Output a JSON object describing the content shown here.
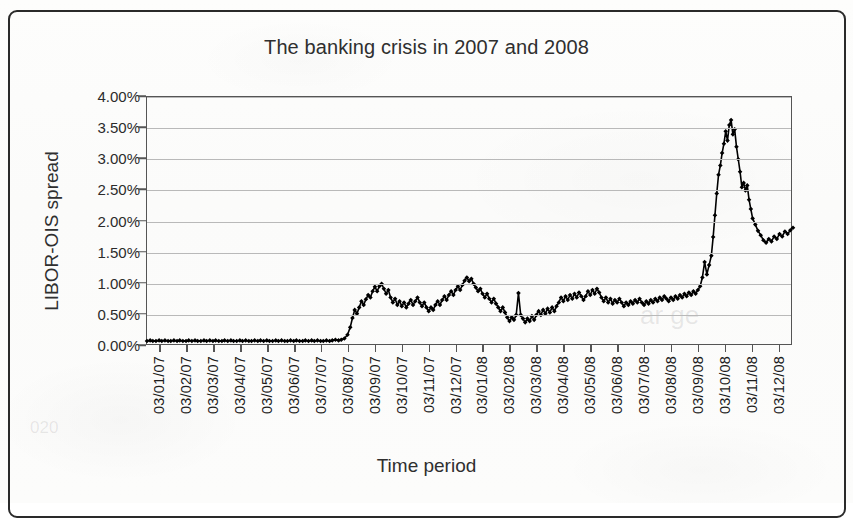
{
  "figure": {
    "title": "The banking crisis in 2007 and 2008",
    "xlabel": "Time period",
    "ylabel": "LIBOR-OIS spread"
  },
  "axes": {
    "y_ticks": [
      "0.00%",
      "0.50%",
      "1.00%",
      "1.50%",
      "2.00%",
      "2.50%",
      "3.00%",
      "3.50%",
      "4.00%"
    ],
    "x_ticks": [
      "03/01/07",
      "03/02/07",
      "03/03/07",
      "03/04/07",
      "03/05/07",
      "03/06/07",
      "03/07/07",
      "03/08/07",
      "03/09/07",
      "03/10/07",
      "03/11/07",
      "03/12/07",
      "03/01/08",
      "03/02/08",
      "03/03/08",
      "03/04/08",
      "03/05/08",
      "03/06/08",
      "03/07/08",
      "03/08/08",
      "03/09/08",
      "03/10/08",
      "03/11/08",
      "03/12/08"
    ]
  },
  "colors": {
    "series": "#000000",
    "gridline": "#b9b9b9",
    "axis": "#555555",
    "text": "#2b2b2b",
    "background": "#fdfdfc"
  },
  "chart_data": {
    "type": "line",
    "title": "The banking crisis in 2007 and 2008",
    "xlabel": "Time period",
    "ylabel": "LIBOR-OIS spread",
    "ylim": [
      0.0,
      4.0
    ],
    "ytick_step": 0.5,
    "grid": true,
    "legend": null,
    "units": "percent",
    "marker": "diamond",
    "x": [
      "03/01/07",
      "03/02/07",
      "03/03/07",
      "03/04/07",
      "03/05/07",
      "03/06/07",
      "03/07/07",
      "03/08/07",
      "03/09/07",
      "03/10/07",
      "03/11/07",
      "03/12/07",
      "03/01/08",
      "03/02/08",
      "03/03/08",
      "03/04/08",
      "03/05/08",
      "03/06/08",
      "03/07/08",
      "03/08/08",
      "03/09/08",
      "03/10/08",
      "03/11/08",
      "03/12/08"
    ],
    "series": [
      {
        "name": "LIBOR-OIS spread",
        "values": [
          0.08,
          0.08,
          0.09,
          0.08,
          0.08,
          0.09,
          0.09,
          0.7,
          0.85,
          0.72,
          0.8,
          1.05,
          0.6,
          0.48,
          0.62,
          0.78,
          0.78,
          0.72,
          0.76,
          0.8,
          1.2,
          3.4,
          2.0,
          1.85
        ]
      }
    ],
    "points": [
      [
        0.0,
        0.08
      ],
      [
        0.007,
        0.09
      ],
      [
        0.013,
        0.08
      ],
      [
        0.02,
        0.08
      ],
      [
        0.027,
        0.09
      ],
      [
        0.033,
        0.08
      ],
      [
        0.04,
        0.09
      ],
      [
        0.047,
        0.08
      ],
      [
        0.053,
        0.08
      ],
      [
        0.06,
        0.09
      ],
      [
        0.067,
        0.08
      ],
      [
        0.073,
        0.09
      ],
      [
        0.08,
        0.08
      ],
      [
        0.087,
        0.08
      ],
      [
        0.093,
        0.09
      ],
      [
        0.1,
        0.08
      ],
      [
        0.107,
        0.09
      ],
      [
        0.113,
        0.08
      ],
      [
        0.12,
        0.08
      ],
      [
        0.127,
        0.09
      ],
      [
        0.133,
        0.08
      ],
      [
        0.14,
        0.09
      ],
      [
        0.147,
        0.08
      ],
      [
        0.153,
        0.09
      ],
      [
        0.16,
        0.08
      ],
      [
        0.167,
        0.08
      ],
      [
        0.173,
        0.09
      ],
      [
        0.18,
        0.08
      ],
      [
        0.187,
        0.09
      ],
      [
        0.193,
        0.08
      ],
      [
        0.2,
        0.08
      ],
      [
        0.207,
        0.09
      ],
      [
        0.213,
        0.08
      ],
      [
        0.22,
        0.09
      ],
      [
        0.227,
        0.08
      ],
      [
        0.233,
        0.08
      ],
      [
        0.24,
        0.09
      ],
      [
        0.247,
        0.08
      ],
      [
        0.253,
        0.09
      ],
      [
        0.26,
        0.08
      ],
      [
        0.267,
        0.09
      ],
      [
        0.273,
        0.08
      ],
      [
        0.28,
        0.08
      ],
      [
        0.287,
        0.09
      ],
      [
        0.293,
        0.08
      ],
      [
        0.3,
        0.09
      ],
      [
        0.307,
        0.08
      ],
      [
        0.313,
        0.08
      ],
      [
        0.32,
        0.09
      ],
      [
        0.327,
        0.08
      ],
      [
        0.333,
        0.09
      ],
      [
        0.34,
        0.08
      ],
      [
        0.347,
        0.08
      ],
      [
        0.353,
        0.09
      ],
      [
        0.36,
        0.08
      ],
      [
        0.367,
        0.09
      ],
      [
        0.373,
        0.08
      ],
      [
        0.38,
        0.09
      ],
      [
        0.387,
        0.08
      ],
      [
        0.393,
        0.08
      ],
      [
        0.4,
        0.09
      ],
      [
        0.407,
        0.08
      ],
      [
        0.413,
        0.09
      ],
      [
        0.42,
        0.1
      ],
      [
        0.427,
        0.09
      ],
      [
        0.433,
        0.1
      ],
      [
        0.44,
        0.12
      ],
      [
        0.447,
        0.18
      ],
      [
        0.453,
        0.3
      ],
      [
        0.458,
        0.45
      ],
      [
        0.463,
        0.58
      ],
      [
        0.468,
        0.52
      ],
      [
        0.473,
        0.62
      ],
      [
        0.478,
        0.72
      ],
      [
        0.483,
        0.66
      ],
      [
        0.488,
        0.75
      ],
      [
        0.493,
        0.82
      ],
      [
        0.498,
        0.78
      ],
      [
        0.503,
        0.88
      ],
      [
        0.508,
        0.95
      ],
      [
        0.513,
        0.88
      ],
      [
        0.518,
        0.96
      ],
      [
        0.523,
        1.0
      ],
      [
        0.528,
        0.92
      ],
      [
        0.533,
        0.84
      ],
      [
        0.538,
        0.9
      ],
      [
        0.543,
        0.78
      ],
      [
        0.548,
        0.7
      ],
      [
        0.553,
        0.76
      ],
      [
        0.558,
        0.66
      ],
      [
        0.563,
        0.72
      ],
      [
        0.568,
        0.64
      ],
      [
        0.573,
        0.7
      ],
      [
        0.578,
        0.62
      ],
      [
        0.583,
        0.68
      ],
      [
        0.588,
        0.74
      ],
      [
        0.593,
        0.66
      ],
      [
        0.598,
        0.72
      ],
      [
        0.603,
        0.78
      ],
      [
        0.608,
        0.7
      ],
      [
        0.613,
        0.64
      ],
      [
        0.618,
        0.7
      ],
      [
        0.623,
        0.62
      ],
      [
        0.628,
        0.56
      ],
      [
        0.633,
        0.62
      ],
      [
        0.638,
        0.58
      ],
      [
        0.643,
        0.66
      ],
      [
        0.648,
        0.72
      ],
      [
        0.653,
        0.66
      ],
      [
        0.658,
        0.74
      ],
      [
        0.663,
        0.8
      ],
      [
        0.668,
        0.74
      ],
      [
        0.673,
        0.82
      ],
      [
        0.678,
        0.88
      ],
      [
        0.683,
        0.82
      ],
      [
        0.688,
        0.9
      ],
      [
        0.693,
        0.96
      ],
      [
        0.698,
        0.9
      ],
      [
        0.703,
        0.98
      ],
      [
        0.708,
        1.05
      ],
      [
        0.713,
        1.1
      ],
      [
        0.718,
        1.04
      ],
      [
        0.723,
        1.08
      ],
      [
        0.728,
        1.0
      ],
      [
        0.733,
        0.94
      ],
      [
        0.738,
        0.88
      ],
      [
        0.743,
        0.92
      ],
      [
        0.748,
        0.84
      ],
      [
        0.753,
        0.78
      ],
      [
        0.758,
        0.84
      ],
      [
        0.763,
        0.76
      ],
      [
        0.768,
        0.7
      ],
      [
        0.773,
        0.76
      ],
      [
        0.778,
        0.68
      ],
      [
        0.783,
        0.62
      ],
      [
        0.788,
        0.56
      ],
      [
        0.793,
        0.62
      ],
      [
        0.798,
        0.54
      ],
      [
        0.803,
        0.46
      ],
      [
        0.808,
        0.4
      ],
      [
        0.813,
        0.46
      ],
      [
        0.818,
        0.42
      ],
      [
        0.823,
        0.5
      ],
      [
        0.828,
        0.85
      ],
      [
        0.833,
        0.5
      ],
      [
        0.838,
        0.44
      ],
      [
        0.843,
        0.38
      ],
      [
        0.848,
        0.44
      ],
      [
        0.853,
        0.4
      ],
      [
        0.858,
        0.48
      ],
      [
        0.863,
        0.42
      ],
      [
        0.868,
        0.5
      ],
      [
        0.873,
        0.56
      ],
      [
        0.878,
        0.5
      ],
      [
        0.883,
        0.58
      ],
      [
        0.888,
        0.52
      ],
      [
        0.893,
        0.6
      ],
      [
        0.898,
        0.54
      ],
      [
        0.903,
        0.62
      ],
      [
        0.908,
        0.56
      ],
      [
        0.913,
        0.64
      ],
      [
        0.918,
        0.7
      ],
      [
        0.923,
        0.78
      ],
      [
        0.928,
        0.72
      ],
      [
        0.933,
        0.8
      ],
      [
        0.938,
        0.74
      ],
      [
        0.943,
        0.82
      ],
      [
        0.948,
        0.76
      ],
      [
        0.953,
        0.84
      ],
      [
        0.958,
        0.78
      ],
      [
        0.963,
        0.86
      ],
      [
        0.968,
        0.8
      ],
      [
        0.973,
        0.74
      ],
      [
        0.978,
        0.8
      ],
      [
        0.983,
        0.88
      ],
      [
        0.988,
        0.82
      ],
      [
        0.993,
        0.9
      ],
      [
        0.998,
        0.84
      ],
      [
        1.003,
        0.92
      ],
      [
        1.008,
        0.86
      ],
      [
        1.013,
        0.78
      ],
      [
        1.018,
        0.72
      ],
      [
        1.023,
        0.78
      ],
      [
        1.028,
        0.7
      ],
      [
        1.033,
        0.76
      ],
      [
        1.038,
        0.68
      ],
      [
        1.043,
        0.74
      ],
      [
        1.048,
        0.7
      ],
      [
        1.053,
        0.76
      ],
      [
        1.058,
        0.7
      ],
      [
        1.063,
        0.64
      ],
      [
        1.068,
        0.7
      ],
      [
        1.073,
        0.66
      ],
      [
        1.078,
        0.72
      ],
      [
        1.083,
        0.68
      ],
      [
        1.088,
        0.74
      ],
      [
        1.093,
        0.7
      ],
      [
        1.098,
        0.76
      ],
      [
        1.103,
        0.7
      ],
      [
        1.108,
        0.66
      ],
      [
        1.113,
        0.72
      ],
      [
        1.118,
        0.68
      ],
      [
        1.123,
        0.74
      ],
      [
        1.128,
        0.7
      ],
      [
        1.133,
        0.76
      ],
      [
        1.138,
        0.72
      ],
      [
        1.143,
        0.78
      ],
      [
        1.148,
        0.74
      ],
      [
        1.153,
        0.8
      ],
      [
        1.158,
        0.76
      ],
      [
        1.163,
        0.72
      ],
      [
        1.168,
        0.78
      ],
      [
        1.173,
        0.74
      ],
      [
        1.178,
        0.8
      ],
      [
        1.183,
        0.76
      ],
      [
        1.188,
        0.82
      ],
      [
        1.193,
        0.78
      ],
      [
        1.198,
        0.84
      ],
      [
        1.203,
        0.8
      ],
      [
        1.208,
        0.86
      ],
      [
        1.213,
        0.82
      ],
      [
        1.218,
        0.88
      ],
      [
        1.223,
        0.84
      ],
      [
        1.228,
        0.9
      ],
      [
        1.233,
        0.96
      ],
      [
        1.238,
        1.1
      ],
      [
        1.243,
        1.35
      ],
      [
        1.248,
        1.15
      ],
      [
        1.253,
        1.3
      ],
      [
        1.258,
        1.45
      ],
      [
        1.262,
        1.75
      ],
      [
        1.266,
        2.1
      ],
      [
        1.27,
        2.45
      ],
      [
        1.274,
        2.75
      ],
      [
        1.278,
        2.9
      ],
      [
        1.282,
        3.1
      ],
      [
        1.286,
        3.25
      ],
      [
        1.29,
        3.45
      ],
      [
        1.294,
        3.3
      ],
      [
        1.298,
        3.55
      ],
      [
        1.302,
        3.63
      ],
      [
        1.306,
        3.4
      ],
      [
        1.31,
        3.48
      ],
      [
        1.314,
        3.2
      ],
      [
        1.318,
        3.0
      ],
      [
        1.322,
        2.8
      ],
      [
        1.326,
        2.55
      ],
      [
        1.33,
        2.62
      ],
      [
        1.334,
        2.5
      ],
      [
        1.338,
        2.58
      ],
      [
        1.342,
        2.35
      ],
      [
        1.346,
        2.2
      ],
      [
        1.35,
        2.05
      ],
      [
        1.356,
        1.95
      ],
      [
        1.362,
        1.85
      ],
      [
        1.368,
        1.78
      ],
      [
        1.374,
        1.7
      ],
      [
        1.38,
        1.66
      ],
      [
        1.386,
        1.72
      ],
      [
        1.392,
        1.68
      ],
      [
        1.398,
        1.76
      ],
      [
        1.404,
        1.72
      ],
      [
        1.41,
        1.8
      ],
      [
        1.416,
        1.76
      ],
      [
        1.422,
        1.84
      ],
      [
        1.428,
        1.8
      ],
      [
        1.434,
        1.86
      ],
      [
        1.44,
        1.9
      ]
    ]
  }
}
